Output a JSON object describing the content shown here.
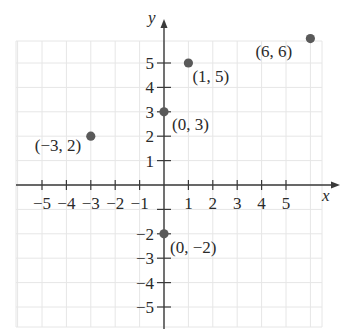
{
  "chart_data": {
    "type": "scatter",
    "title": "",
    "xlabel": "x",
    "ylabel": "y",
    "xlim": [
      -6,
      6.5
    ],
    "ylim": [
      -6,
      6.5
    ],
    "grid": true,
    "x_ticks": [
      -5,
      -4,
      -3,
      -2,
      -1,
      1,
      2,
      3,
      4,
      5
    ],
    "y_ticks": [
      -5,
      -4,
      -3,
      -2,
      1,
      2,
      3,
      4,
      5
    ],
    "x_tick_labels": [
      "−5",
      "−4",
      "−3",
      "−2",
      "−1",
      "1",
      "2",
      "3",
      "4",
      "5"
    ],
    "y_tick_labels": [
      "−5",
      "−4",
      "−3",
      "−2",
      "1",
      "2",
      "3",
      "4",
      "5"
    ],
    "points": [
      {
        "x": -3,
        "y": 2,
        "label": "(−3, 2)"
      },
      {
        "x": 0,
        "y": 3,
        "label": "(0, 3)"
      },
      {
        "x": 1,
        "y": 5,
        "label": "(1, 5)"
      },
      {
        "x": 6,
        "y": 6,
        "label": "(6, 6)"
      },
      {
        "x": 0,
        "y": -2,
        "label": "(0, −2)"
      }
    ],
    "colors": {
      "point": "#5a5a5a",
      "axis": "#3a3a3a",
      "grid": "#e6e6e6",
      "text": "#2a2a2a"
    }
  },
  "axes": {
    "x_label": "x",
    "y_label": "y"
  }
}
